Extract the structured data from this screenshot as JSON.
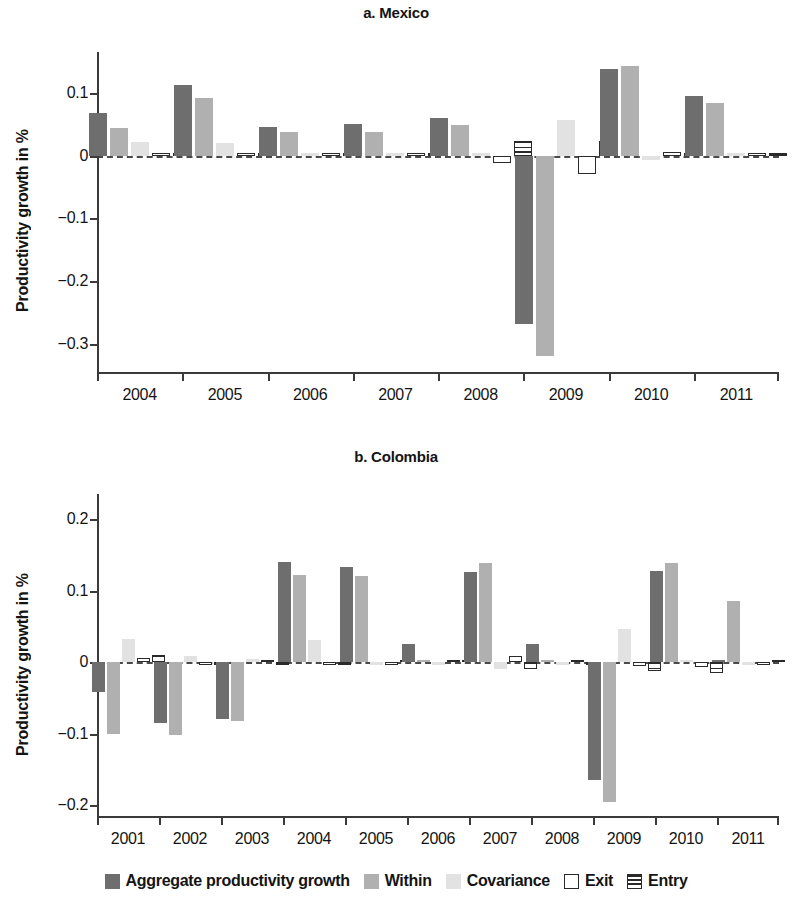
{
  "figure": {
    "ylabel": "Productivity growth in %"
  },
  "legend": {
    "items": [
      {
        "key": "agg",
        "label": "Aggregate productivity growth",
        "color": "#6e6e6e"
      },
      {
        "key": "within",
        "label": "Within",
        "color": "#b0b0b0"
      },
      {
        "key": "cov",
        "label": "Covariance",
        "color": "#e2e2e2"
      },
      {
        "key": "exit",
        "label": "Exit",
        "color": "#ffffff"
      },
      {
        "key": "entry",
        "label": "Entry",
        "color": "#ffffff"
      }
    ]
  },
  "chart_data": [
    {
      "type": "bar",
      "title": "a. Mexico",
      "xlabel": "",
      "ylabel": "Productivity growth in %",
      "categories": [
        "2004",
        "2005",
        "2006",
        "2007",
        "2008",
        "2009",
        "2010",
        "2011"
      ],
      "yticks": [
        0.1,
        0,
        -0.1,
        -0.2,
        -0.3
      ],
      "yticklabels": [
        "0.1",
        "0",
        "−0.1",
        "−0.2",
        "−0.3"
      ],
      "ylim": [
        -0.345,
        0.165
      ],
      "grid": false,
      "legend_position": "bottom",
      "series": [
        {
          "name": "Aggregate productivity growth",
          "values": [
            0.067,
            0.112,
            0.046,
            0.05,
            0.06,
            -0.268,
            0.138,
            0.095
          ]
        },
        {
          "name": "Within",
          "values": [
            0.044,
            0.091,
            0.037,
            0.038,
            0.049,
            -0.32,
            0.142,
            0.084
          ]
        },
        {
          "name": "Covariance",
          "values": [
            0.021,
            0.02,
            0.0,
            0.004,
            0.0,
            0.057,
            -0.007,
            0.004
          ]
        },
        {
          "name": "Exit",
          "values": [
            0.0,
            0.0,
            0.0,
            0.002,
            -0.012,
            -0.03,
            0.006,
            0.001
          ]
        },
        {
          "name": "Entry",
          "values": [
            0.001,
            0.001,
            0.001,
            0.002,
            0.023,
            0.023,
            0.001,
            0.002
          ]
        }
      ]
    },
    {
      "type": "bar",
      "title": "b. Colombia",
      "xlabel": "",
      "ylabel": "Productivity growth in %",
      "categories": [
        "2001",
        "2002",
        "2003",
        "2004",
        "2005",
        "2006",
        "2007",
        "2008",
        "2009",
        "2010",
        "2011"
      ],
      "yticks": [
        0.2,
        0.1,
        0,
        -0.1,
        -0.2
      ],
      "yticklabels": [
        "0.2",
        "0.1",
        "0",
        "−0.1",
        "−0.2"
      ],
      "ylim": [
        -0.215,
        0.235
      ],
      "grid": false,
      "legend_position": "bottom",
      "series": [
        {
          "name": "Aggregate productivity growth",
          "values": [
            -0.042,
            -0.085,
            -0.079,
            0.14,
            0.133,
            0.025,
            0.126,
            0.025,
            -0.165,
            0.127,
            0.003
          ]
        },
        {
          "name": "Within",
          "values": [
            -0.1,
            -0.102,
            -0.082,
            0.122,
            0.121,
            0.002,
            0.138,
            0.001,
            -0.195,
            0.138,
            0.085
          ]
        },
        {
          "name": "Covariance",
          "values": [
            0.033,
            0.008,
            0.004,
            0.031,
            -0.003,
            -0.002,
            -0.01,
            -0.004,
            0.047,
            0.003,
            -0.002
          ]
        },
        {
          "name": "Exit",
          "values": [
            0.006,
            -0.004,
            0.0,
            -0.004,
            -0.002,
            0.0,
            0.009,
            0.0,
            -0.006,
            -0.007,
            -0.001
          ]
        },
        {
          "name": "Entry",
          "values": [
            0.01,
            -0.002,
            -0.002,
            -0.003,
            0.003,
            0.002,
            -0.01,
            -0.002,
            -0.013,
            -0.015,
            0.002
          ]
        }
      ]
    }
  ]
}
